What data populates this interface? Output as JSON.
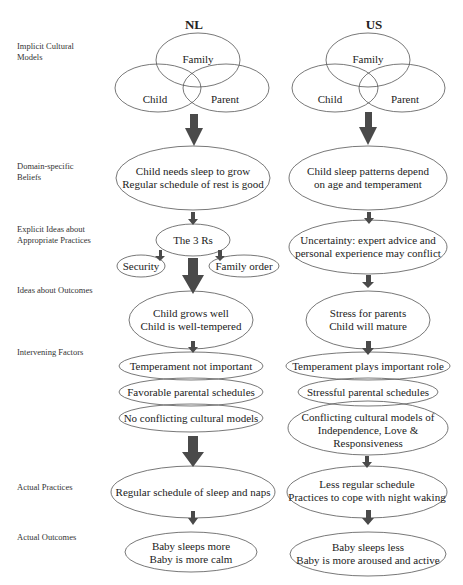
{
  "columns": {
    "nl": {
      "title": "NL"
    },
    "us": {
      "title": "US"
    }
  },
  "row_labels": [
    "Implicit Cultural Models",
    "Domain-specific Beliefs",
    "Explicit Ideas about Appropriate Practices",
    "Ideas about Outcomes",
    "Intervening Factors",
    "Actual Practices",
    "Actual Outcomes"
  ],
  "venn": {
    "family": "Family",
    "child": "Child",
    "parent": "Parent"
  },
  "nl_nodes": {
    "beliefs": "Child needs sleep to grow\nRegular schedule of rest is good",
    "three_rs": "The 3 Rs",
    "security": "Security",
    "family_order": "Family order",
    "outcomes_ideas": "Child grows well\nChild is well-tempered",
    "factor_1": "Temperament not important",
    "factor_2": "Favorable parental schedules",
    "factor_3": "No conflicting cultural models",
    "practices": "Regular schedule of sleep and naps",
    "outcomes": "Baby sleeps more\nBaby is more calm"
  },
  "us_nodes": {
    "beliefs": "Child sleep patterns depend\non age and temperament",
    "explicit": "Uncertainty: expert advice and\npersonal experience may conflict",
    "outcomes_ideas": "Stress for parents\nChild will mature",
    "factor_1": "Temperament plays important role",
    "factor_2": "Stressful parental schedules",
    "factor_3": "Conflicting cultural models of\nIndependence, Love &\nResponsiveness",
    "practices": "Less regular schedule\nPractices to cope with night waking",
    "outcomes": "Baby sleeps less\nBaby is more aroused and active"
  },
  "colors": {
    "arrow": "#4a4a4a",
    "outline": "#555555",
    "background": "#ffffff"
  }
}
